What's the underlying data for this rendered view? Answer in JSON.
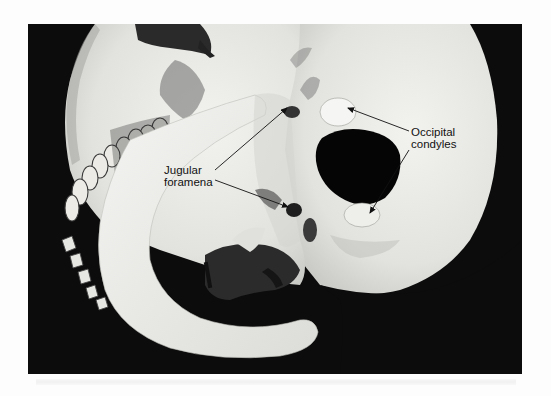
{
  "figure": {
    "background_color": "#0c0c0c",
    "bone_color": "#e9e9e6",
    "page_color": "#fdfdfd"
  },
  "labels": {
    "occipital_condyles": {
      "line1": "Occipital",
      "line2": "condyles"
    },
    "jugular_foramena": {
      "line1": "Jugular",
      "line2": "foramena"
    }
  },
  "annotations": [
    {
      "label": "Occipital condyles",
      "from": [
        409,
        131
      ],
      "to": [
        348,
        108
      ]
    },
    {
      "label": "Occipital condyles",
      "from": [
        409,
        150
      ],
      "to": [
        370,
        213
      ]
    },
    {
      "label": "Jugular foramena",
      "from": [
        215,
        170
      ],
      "to": [
        287,
        108
      ]
    },
    {
      "label": "Jugular foramena",
      "from": [
        215,
        180
      ],
      "to": [
        288,
        207
      ]
    }
  ]
}
